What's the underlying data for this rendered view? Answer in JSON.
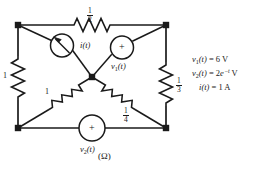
{
  "figure": {
    "caption": "(Ω)",
    "units_note": "ohms"
  },
  "components": {
    "r_top": {
      "name": "top-resistor",
      "value_num": "1",
      "value_den": "2",
      "display": "1/2"
    },
    "r_left": {
      "name": "left-resistor",
      "value_whole": "1",
      "display": "1"
    },
    "r_right": {
      "name": "right-resistor",
      "value_num": "1",
      "value_den": "3",
      "display": "1/3"
    },
    "r_diag_lower_left": {
      "name": "lower-left-diagonal-resistor",
      "value_whole": "1",
      "display": "1"
    },
    "r_diag_lower_right": {
      "name": "lower-right-diagonal-resistor",
      "value_num": "1",
      "value_den": "4",
      "display": "1/4"
    },
    "current_source": {
      "name": "current-source",
      "label_main": "i",
      "label_arg": "(t)",
      "symbol": "arrow"
    },
    "v1_source": {
      "name": "v1-voltage-source",
      "label_main": "v",
      "label_sub": "1",
      "label_arg": "(t)",
      "polarity": "+"
    },
    "v2_source": {
      "name": "v2-voltage-source",
      "label_main": "v",
      "label_sub": "2",
      "label_arg": "(t)",
      "polarity": "+"
    }
  },
  "legend": {
    "line1": {
      "sym": "v",
      "sub": "1",
      "arg": "(t)",
      "eq": " = 6 V"
    },
    "line2": {
      "sym": "v",
      "sub": "2",
      "arg": "(t)",
      "eq_pre": " = 2",
      "base": "e",
      "exp": "−t",
      "eq_post": " V"
    },
    "line3": {
      "sym": "i",
      "arg": "(t)",
      "eq": " = 1 A"
    }
  },
  "colors": {
    "wire": "#1a1a1a",
    "background": "#ffffff",
    "text": "#1a1a1a"
  }
}
